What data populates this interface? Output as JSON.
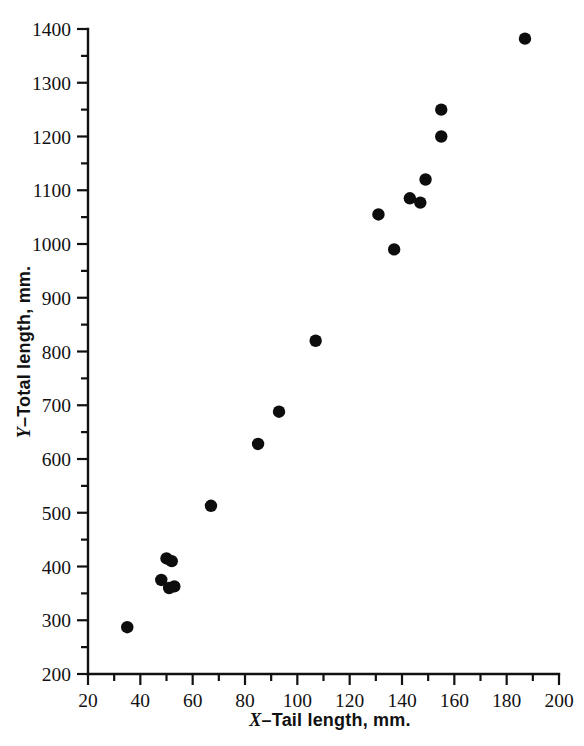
{
  "chart_data": {
    "type": "scatter",
    "title": "",
    "xlabel": "X–Tail length, mm.",
    "ylabel": "Y–Total length, mm.",
    "xlabel_var": "X",
    "xlabel_rest": "–Tail length, mm.",
    "ylabel_var": "Y",
    "ylabel_rest": "–Total length, mm.",
    "xlim": [
      20,
      200
    ],
    "ylim": [
      200,
      1400
    ],
    "x_major_ticks": [
      20,
      40,
      60,
      80,
      100,
      120,
      140,
      160,
      180,
      200
    ],
    "x_minor_ticks": [
      30,
      50,
      70,
      90,
      110,
      130,
      150,
      170,
      190
    ],
    "y_major_ticks": [
      200,
      300,
      400,
      500,
      600,
      700,
      800,
      900,
      1000,
      1100,
      1200,
      1300,
      1400
    ],
    "y_minor_ticks": [
      250,
      350,
      450,
      550,
      650,
      750,
      850,
      950,
      1050,
      1150,
      1250,
      1350
    ],
    "x_tick_labels": [
      "20",
      "40",
      "60",
      "80",
      "100",
      "120",
      "140",
      "160",
      "180",
      "200"
    ],
    "y_tick_labels": [
      "200",
      "300",
      "400",
      "500",
      "600",
      "700",
      "800",
      "900",
      "1000",
      "1100",
      "1200",
      "1300",
      "1400"
    ],
    "grid": false,
    "legend": null,
    "marker": "filled-circle",
    "marker_color": "#0d0d0d",
    "marker_radius": 6.2,
    "points": [
      {
        "x": 35,
        "y": 287
      },
      {
        "x": 48,
        "y": 375
      },
      {
        "x": 50,
        "y": 415
      },
      {
        "x": 51,
        "y": 360
      },
      {
        "x": 52,
        "y": 410
      },
      {
        "x": 53,
        "y": 363
      },
      {
        "x": 67,
        "y": 513
      },
      {
        "x": 85,
        "y": 628
      },
      {
        "x": 93,
        "y": 688
      },
      {
        "x": 107,
        "y": 820
      },
      {
        "x": 131,
        "y": 1055
      },
      {
        "x": 137,
        "y": 990
      },
      {
        "x": 143,
        "y": 1085
      },
      {
        "x": 147,
        "y": 1077
      },
      {
        "x": 149,
        "y": 1120
      },
      {
        "x": 155,
        "y": 1200
      },
      {
        "x": 155,
        "y": 1250
      },
      {
        "x": 187,
        "y": 1382
      }
    ]
  },
  "axes": {
    "x_label_display": "X–Tail length, mm.",
    "y_label_display": "Y–Total length, mm."
  }
}
